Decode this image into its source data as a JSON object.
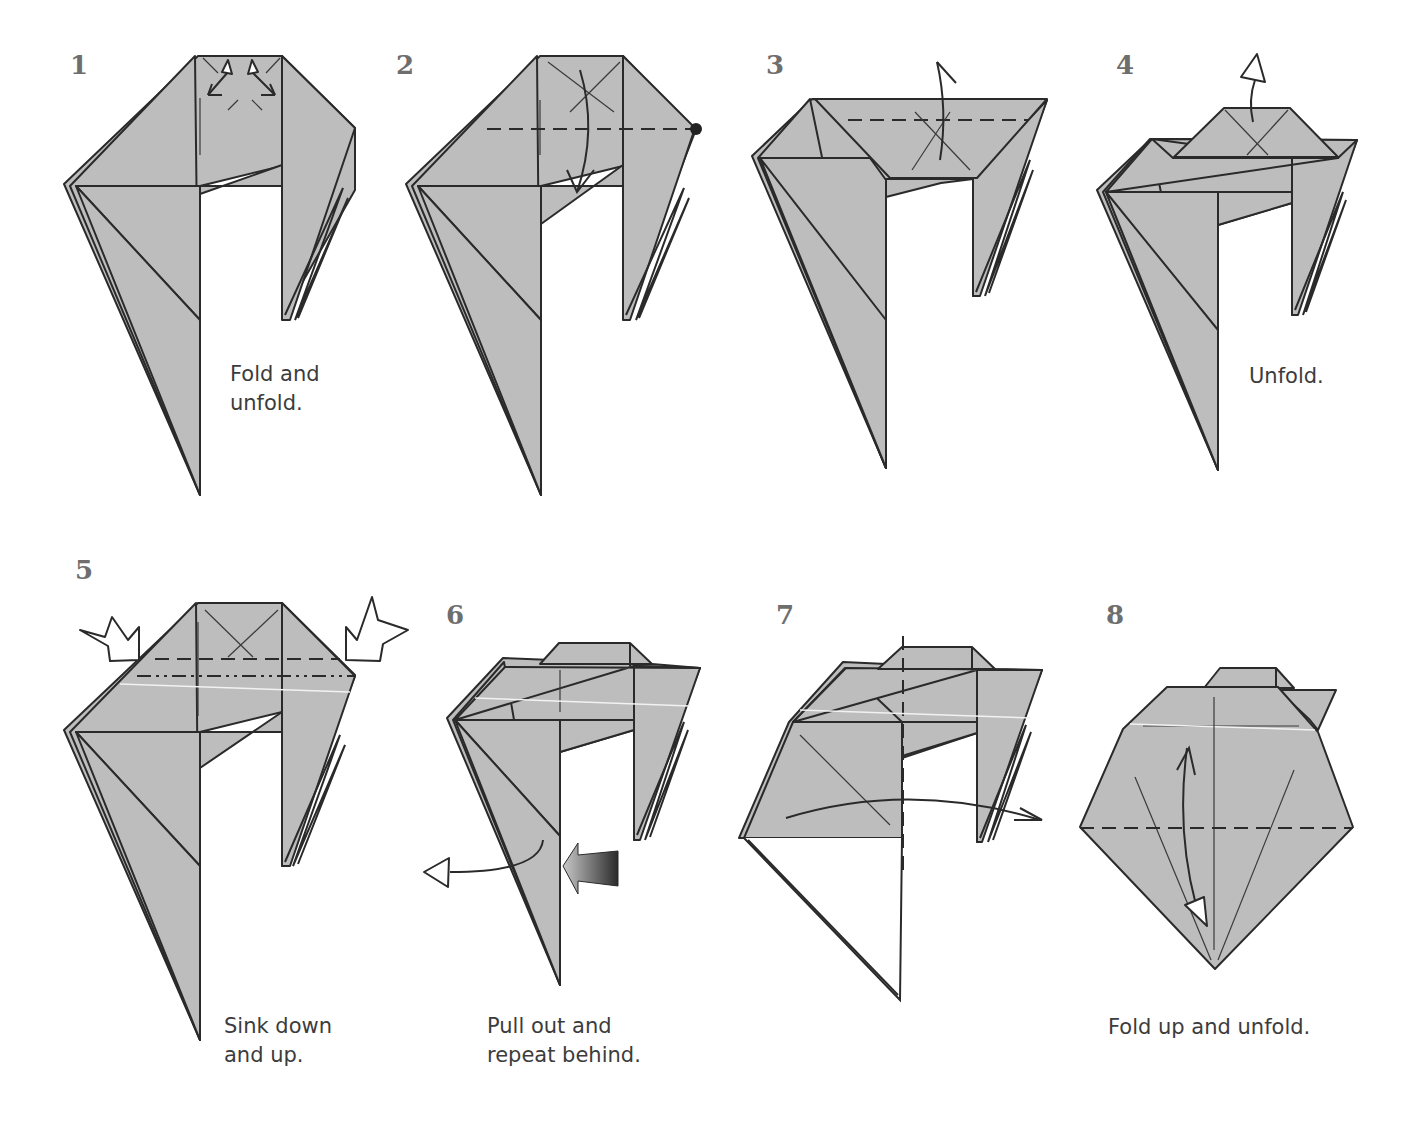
{
  "diagram": {
    "type": "origami-instructions",
    "colors": {
      "paper": "#bdbdbd",
      "line": "#2a2a2a",
      "number": "#6e6e6e",
      "text": "#3c3c3c",
      "background": "#ffffff"
    },
    "steps": [
      {
        "number": "1",
        "caption": "Fold and\nunfold.",
        "symbols": [
          "fold-and-unfold-arrows",
          "valley-crease-x"
        ]
      },
      {
        "number": "2",
        "caption": "",
        "symbols": [
          "valley-fold-line",
          "reference-dot",
          "fold-down-arrow"
        ]
      },
      {
        "number": "3",
        "caption": "",
        "symbols": [
          "valley-fold-line",
          "fold-up-arrow"
        ]
      },
      {
        "number": "4",
        "caption": "Unfold.",
        "symbols": [
          "unfold-arrow"
        ]
      },
      {
        "number": "5",
        "caption": "Sink down\nand up.",
        "symbols": [
          "sink-arrow-left",
          "sink-arrow-right",
          "valley-fold-line",
          "mountain-fold-line"
        ]
      },
      {
        "number": "6",
        "caption": "Pull out and\nrepeat behind.",
        "symbols": [
          "pull-out-arrow",
          "push-arrow"
        ]
      },
      {
        "number": "7",
        "caption": "",
        "symbols": [
          "vertical-valley-fold-line",
          "fold-over-arrow"
        ]
      },
      {
        "number": "8",
        "caption": "Fold up and unfold.",
        "symbols": [
          "valley-fold-line",
          "fold-and-unfold-arrow"
        ]
      }
    ]
  }
}
